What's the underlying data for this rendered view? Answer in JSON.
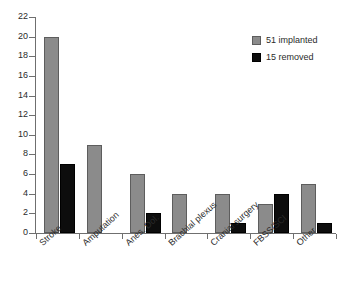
{
  "chart_data": {
    "type": "bar",
    "title": "",
    "subtitle": "",
    "xlabel": "",
    "ylabel": "",
    "ylim": [
      0,
      22
    ],
    "ytick_step": 2,
    "yticks": [
      0,
      2,
      4,
      6,
      8,
      10,
      12,
      14,
      16,
      18,
      20,
      22
    ],
    "ytick_labels": [
      "0",
      "2",
      "4",
      "6",
      "8",
      "10",
      "12",
      "14",
      "16",
      "18",
      "20",
      "22"
    ],
    "grid": false,
    "legend_position": "top-right",
    "categories": [
      "Stroke",
      "Amputation",
      "Anes. Dol.",
      "Brachial plexus",
      "Cranial surgery",
      "FBSS/SCI",
      "Other"
    ],
    "series": [
      {
        "name": "51 implanted",
        "color": "#8b8b8b",
        "values": [
          20,
          9,
          6,
          4,
          4,
          3,
          5
        ]
      },
      {
        "name": "15 removed",
        "color": "#0d0d0d",
        "values": [
          7,
          0,
          2,
          0,
          1,
          4,
          1
        ]
      }
    ],
    "annotations": []
  },
  "legend": {
    "items": [
      {
        "label": "51 implanted",
        "swatch": "implanted"
      },
      {
        "label": "15 removed",
        "swatch": "removed"
      }
    ]
  }
}
